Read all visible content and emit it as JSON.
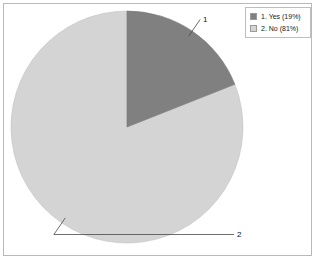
{
  "chart_data": {
    "type": "pie",
    "title": "",
    "categories": [
      "1. Yes",
      "2. No"
    ],
    "values": [
      19,
      81
    ],
    "value_unit": "percent",
    "slice_labels": [
      "1",
      "2"
    ],
    "legend_position": "top-right",
    "grid": false,
    "slices": [
      {
        "index": 1,
        "name": "Yes",
        "legend_label": "1. Yes (19%)",
        "callout_label": "1",
        "percent": 19,
        "color": "#808080"
      },
      {
        "index": 2,
        "name": "No",
        "legend_label": "2. No (81%)",
        "callout_label": "2",
        "percent": 81,
        "color": "#d4d4d4"
      }
    ]
  },
  "legend": {
    "entries": [
      {
        "label": "1. Yes (19%)",
        "color": "#808080"
      },
      {
        "label": "2. No (81%)",
        "color": "#d4d4d4"
      }
    ]
  },
  "colors": {
    "slice_yes": "#808080",
    "slice_no": "#d4d4d4",
    "slice_outline": "#b0b0b0",
    "frame_border": "#b9b9b9",
    "legend_border": "#bdbdbd",
    "leader_line": "#555555",
    "background": "#ffffff",
    "text": "#111111"
  }
}
